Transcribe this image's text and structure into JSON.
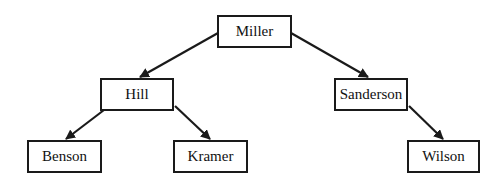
{
  "diagram": {
    "type": "tree",
    "nodes": [
      {
        "id": "miller",
        "label": "Miller",
        "x": 217,
        "y": 15,
        "w": 75,
        "h": 33
      },
      {
        "id": "hill",
        "label": "Hill",
        "x": 100,
        "y": 78,
        "w": 74,
        "h": 33
      },
      {
        "id": "sanderson",
        "label": "Sanderson",
        "x": 334,
        "y": 78,
        "w": 74,
        "h": 33
      },
      {
        "id": "benson",
        "label": "Benson",
        "x": 27,
        "y": 140,
        "w": 75,
        "h": 33
      },
      {
        "id": "kramer",
        "label": "Kramer",
        "x": 173,
        "y": 140,
        "w": 75,
        "h": 33
      },
      {
        "id": "wilson",
        "label": "Wilson",
        "x": 407,
        "y": 140,
        "w": 73,
        "h": 33
      }
    ],
    "edges": [
      {
        "from": "miller",
        "to": "hill"
      },
      {
        "from": "miller",
        "to": "sanderson"
      },
      {
        "from": "hill",
        "to": "benson"
      },
      {
        "from": "hill",
        "to": "kramer"
      },
      {
        "from": "sanderson",
        "to": "wilson"
      }
    ]
  }
}
